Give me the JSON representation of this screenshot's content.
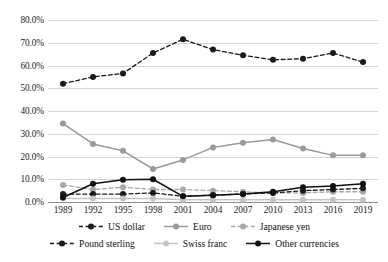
{
  "chart_data": {
    "type": "line",
    "title": "",
    "xlabel": "",
    "ylabel": "",
    "categories": [
      "1989",
      "1992",
      "1995",
      "1998",
      "2001",
      "2004",
      "2007",
      "2010",
      "2013",
      "2016",
      "2019"
    ],
    "ylim": [
      0,
      80
    ],
    "ytick_labels": [
      "0.0%",
      "10.0%",
      "20.0%",
      "30.0%",
      "40.0%",
      "50.0%",
      "60.0%",
      "70.0%",
      "80.0%"
    ],
    "ytick_values": [
      0,
      10,
      20,
      30,
      40,
      50,
      60,
      70,
      80
    ],
    "grid": true,
    "legend_position": "bottom",
    "series": [
      {
        "name": "US dollar",
        "color": "#1a1a1a",
        "style": "dashed",
        "marker": "circle",
        "values": [
          52.0,
          55.0,
          56.5,
          65.5,
          71.5,
          67.0,
          64.5,
          62.5,
          63.0,
          65.5,
          61.5
        ]
      },
      {
        "name": "Euro",
        "color": "#9a9a9a",
        "style": "solid",
        "marker": "circle",
        "values": [
          34.5,
          25.5,
          22.5,
          14.5,
          18.5,
          24.0,
          26.0,
          27.5,
          23.5,
          20.5,
          20.5
        ]
      },
      {
        "name": "Japanese yen",
        "color": "#a8a8a8",
        "style": "dashed",
        "marker": "circle",
        "values": [
          7.5,
          5.5,
          6.5,
          5.5,
          5.5,
          5.0,
          4.5,
          4.0,
          4.0,
          4.5,
          4.5
        ]
      },
      {
        "name": "Pound sterling",
        "color": "#1a1a1a",
        "style": "dashed",
        "marker": "circle",
        "values": [
          3.5,
          3.5,
          3.5,
          4.0,
          2.5,
          3.0,
          3.5,
          4.0,
          5.0,
          5.5,
          6.0
        ]
      },
      {
        "name": "Swiss franc",
        "color": "#c4c4c4",
        "style": "solid",
        "marker": "circle",
        "values": [
          1.5,
          1.5,
          1.5,
          1.5,
          1.0,
          1.0,
          1.0,
          1.0,
          1.0,
          1.0,
          1.0
        ]
      },
      {
        "name": "Other currencies",
        "color": "#111111",
        "style": "solid",
        "marker": "circle",
        "values": [
          2.0,
          8.0,
          9.8,
          10.0,
          2.5,
          3.0,
          3.5,
          4.5,
          6.5,
          7.0,
          8.0
        ]
      }
    ]
  }
}
